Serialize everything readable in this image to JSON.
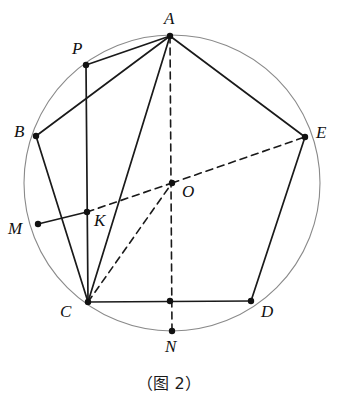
{
  "figure": {
    "caption": "（图 2）",
    "canvas": {
      "width": 338,
      "height": 403
    },
    "colors": {
      "circle_stroke": "#8a8a8a",
      "line_stroke": "#1a1a1a",
      "dash_stroke": "#1a1a1a",
      "point_fill": "#111111",
      "background": "#ffffff",
      "label_color": "#111111"
    },
    "circle": {
      "cx": 172,
      "cy": 183,
      "r": 148,
      "stroke_width": 1.1
    },
    "points": [
      {
        "id": "A",
        "label": "A",
        "x": 170,
        "y": 36,
        "label_x": 164,
        "label_y": 10,
        "on_circle": true
      },
      {
        "id": "P",
        "label": "P",
        "x": 86,
        "y": 65,
        "label_x": 72,
        "label_y": 40,
        "on_circle": true
      },
      {
        "id": "B",
        "label": "B",
        "x": 36,
        "y": 136,
        "label_x": 14,
        "label_y": 123,
        "on_circle": true
      },
      {
        "id": "E",
        "label": "E",
        "x": 305,
        "y": 137,
        "label_x": 316,
        "label_y": 124,
        "on_circle": true
      },
      {
        "id": "O",
        "label": "O",
        "x": 172,
        "y": 183,
        "label_x": 182,
        "label_y": 183,
        "on_circle": false
      },
      {
        "id": "M",
        "label": "M",
        "x": 38,
        "y": 224,
        "label_x": 8,
        "label_y": 220,
        "on_circle": true
      },
      {
        "id": "K",
        "label": "K",
        "x": 87,
        "y": 212,
        "label_x": 94,
        "label_y": 212,
        "on_circle": false
      },
      {
        "id": "C",
        "label": "C",
        "x": 88,
        "y": 302,
        "label_x": 60,
        "label_y": 303,
        "on_circle": true
      },
      {
        "id": "D",
        "label": "D",
        "x": 251,
        "y": 301,
        "label_x": 261,
        "label_y": 303,
        "on_circle": true
      },
      {
        "id": "N",
        "label": "N",
        "x": 172,
        "y": 331,
        "label_x": 165,
        "label_y": 338,
        "on_circle": true
      },
      {
        "id": "F",
        "label": "",
        "x": 170,
        "y": 301,
        "label_x": 0,
        "label_y": 0,
        "on_circle": false
      }
    ],
    "solid_segments": [
      {
        "name": "segment-A-P",
        "from": "A",
        "to": "P"
      },
      {
        "name": "segment-A-B",
        "from": "A",
        "to": "B"
      },
      {
        "name": "segment-A-E",
        "from": "A",
        "to": "E"
      },
      {
        "name": "segment-A-C",
        "from": "A",
        "to": "C"
      },
      {
        "name": "segment-P-C",
        "from": "P",
        "to": "C"
      },
      {
        "name": "segment-B-C",
        "from": "B",
        "to": "C"
      },
      {
        "name": "segment-C-D",
        "from": "C",
        "to": "D"
      },
      {
        "name": "segment-D-E",
        "from": "D",
        "to": "E"
      },
      {
        "name": "segment-M-K",
        "from": "M",
        "to": "K"
      }
    ],
    "dashed_segments": [
      {
        "name": "segment-A-O-N",
        "from": "A",
        "to": "N"
      },
      {
        "name": "segment-K-O",
        "from": "K",
        "to": "O"
      },
      {
        "name": "segment-O-E",
        "from": "O",
        "to": "E"
      },
      {
        "name": "segment-C-O",
        "from": "C",
        "to": "O"
      }
    ]
  }
}
